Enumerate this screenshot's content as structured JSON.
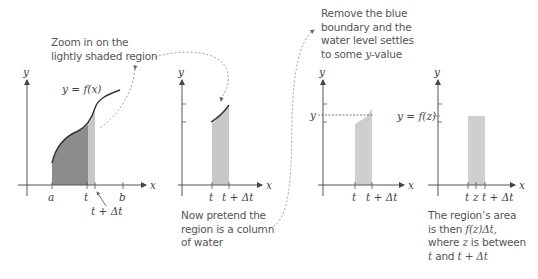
{
  "colors": {
    "axis": "#555555",
    "curve": "#333333",
    "dark_fill": "#8c8c8c",
    "light_fill": "#c8c8c8",
    "water_fill": "#cfcfcf",
    "dashed_arrow": "#999999",
    "text": "#555555"
  },
  "panels": [
    {
      "id": "panel-1",
      "axis_labels": {
        "x": "x",
        "y": "y"
      },
      "curve_label": "y = f(x)",
      "tick_labels": [
        "a",
        "t",
        "b"
      ],
      "pointer_label": "t + Δt"
    },
    {
      "id": "panel-2",
      "axis_labels": {
        "x": "x",
        "y": "y"
      },
      "tick_labels": [
        "t",
        "t + Δt"
      ]
    },
    {
      "id": "panel-3",
      "axis_labels": {
        "x": "x",
        "y": "y"
      },
      "level_label": "y",
      "tick_labels": [
        "t",
        "t + Δt"
      ]
    },
    {
      "id": "panel-4",
      "axis_labels": {
        "x": "x",
        "y": "y"
      },
      "level_label": "y = f(z)",
      "tick_labels": [
        "t",
        "z",
        "t + Δt"
      ]
    }
  ],
  "captions": {
    "zoom": [
      "Zoom in on the",
      "lightly shaded region"
    ],
    "water": [
      "Now pretend the",
      "region is a column",
      "of water"
    ],
    "remove": [
      "Remove the blue",
      "boundary and the",
      "water level settles",
      "to some "
    ],
    "remove_var": "y",
    "remove_tail": "-value",
    "area_l1": "The region’s area",
    "area_l2_a": "is then ",
    "area_l2_math": "f(z)Δt,",
    "area_l3_a": "where ",
    "area_l3_math": "z",
    "area_l3_b": " is between",
    "area_l4_math1": "t",
    "area_l4_b": " and ",
    "area_l4_math2": "t + Δt"
  }
}
